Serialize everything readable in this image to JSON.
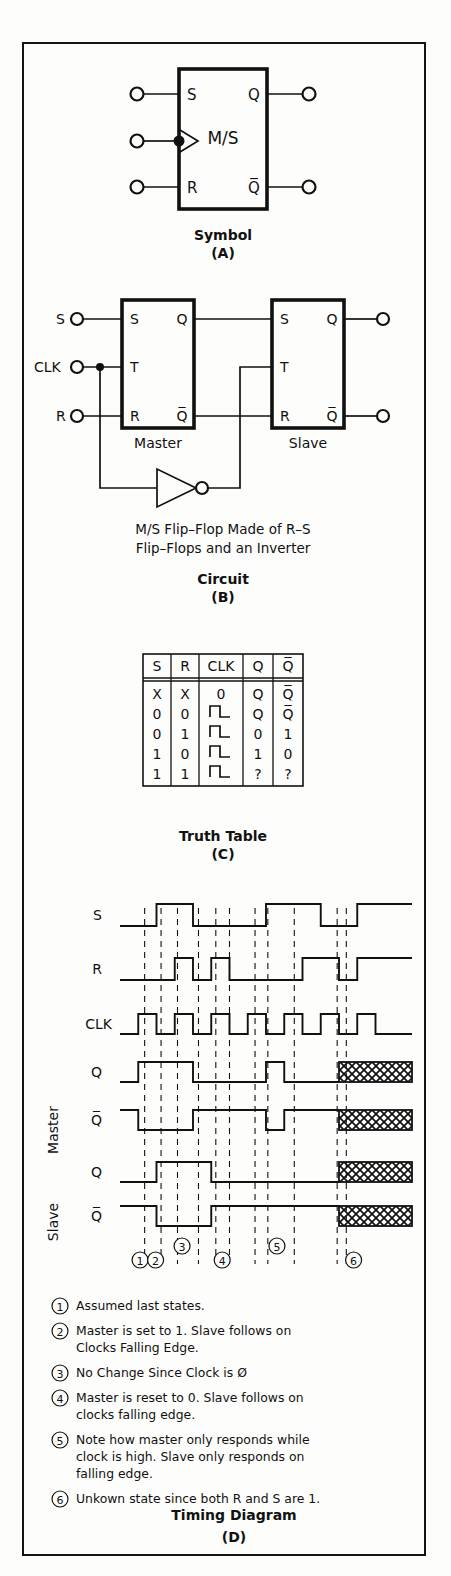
{
  "document": {
    "subject": "Master/Slave Flip-Flop",
    "panels": [
      "A",
      "B",
      "C",
      "D"
    ]
  },
  "symbol_panel": {
    "caption": "Symbol",
    "letter": "(A)",
    "block_label": "M/S",
    "inputs": [
      "S",
      "R"
    ],
    "outputs": [
      "Q",
      "Q̅"
    ],
    "clock_input_is_inverting": true
  },
  "circuit_panel": {
    "caption": "Circuit",
    "letter": "(B)",
    "description_line1": "M/S Flip–Flop Made of R–S",
    "description_line2": "Flip–Flops and an Inverter",
    "input_labels": [
      "S",
      "CLK",
      "R"
    ],
    "master_label": "Master",
    "slave_label": "Slave",
    "master_pins": {
      "left": [
        "S",
        "T",
        "R"
      ],
      "right": [
        "Q",
        "Q̅"
      ]
    },
    "slave_pins": {
      "left": [
        "S",
        "T",
        "R"
      ],
      "right": [
        "Q",
        "Q̅"
      ]
    }
  },
  "truth_table_panel": {
    "caption": "Truth Table",
    "letter": "(C)",
    "headers": [
      "S",
      "R",
      "CLK",
      "Q",
      "Q̅"
    ],
    "rows": [
      {
        "S": "X",
        "R": "X",
        "CLK": "0",
        "Q": "Q",
        "Qbar": "Q̅"
      },
      {
        "S": "0",
        "R": "0",
        "CLK": "pulse",
        "Q": "Q",
        "Qbar": "Q̅"
      },
      {
        "S": "0",
        "R": "1",
        "CLK": "pulse",
        "Q": "0",
        "Qbar": "1"
      },
      {
        "S": "1",
        "R": "0",
        "CLK": "pulse",
        "Q": "1",
        "Qbar": "0"
      },
      {
        "S": "1",
        "R": "1",
        "CLK": "pulse",
        "Q": "?",
        "Qbar": "?"
      }
    ]
  },
  "timing_panel": {
    "caption": "Timing Diagram",
    "letter": "(D)",
    "signal_labels": [
      "S",
      "R",
      "CLK",
      "Q",
      "Q̅",
      "Q",
      "Q̅"
    ],
    "group_labels": [
      "Master",
      "Slave"
    ],
    "markers": [
      "1",
      "2",
      "3",
      "4",
      "5",
      "6"
    ],
    "chart_data": {
      "type": "line",
      "title": "Timing Diagram",
      "xlabel": "",
      "ylabel": "",
      "x": [
        0,
        100
      ],
      "grid": false,
      "legend": "none",
      "note": "Digital logic waveforms, value 0 = low, 1 = high, ? = undefined (cross-hatched)",
      "series": [
        {
          "name": "S",
          "values": [
            0,
            0,
            1,
            1,
            0,
            0,
            0,
            0,
            1,
            1,
            1,
            0,
            0,
            1,
            1,
            1
          ]
        },
        {
          "name": "R",
          "values": [
            0,
            0,
            0,
            1,
            0,
            1,
            0,
            0,
            0,
            0,
            1,
            1,
            0,
            1,
            1,
            1
          ]
        },
        {
          "name": "CLK",
          "values": [
            0,
            1,
            0,
            1,
            0,
            1,
            0,
            1,
            0,
            1,
            0,
            1,
            0,
            1,
            0,
            0
          ]
        },
        {
          "name": "Master Q",
          "values": [
            0,
            1,
            1,
            1,
            0,
            0,
            0,
            0,
            1,
            0,
            0,
            0,
            "?",
            "?",
            "?",
            "?"
          ]
        },
        {
          "name": "Master Q̅",
          "values": [
            1,
            0,
            0,
            0,
            1,
            1,
            1,
            1,
            0,
            1,
            1,
            1,
            "?",
            "?",
            "?",
            "?"
          ]
        },
        {
          "name": "Slave Q",
          "values": [
            0,
            0,
            1,
            1,
            1,
            0,
            0,
            0,
            0,
            0,
            0,
            0,
            "?",
            "?",
            "?",
            "?"
          ]
        },
        {
          "name": "Slave Q̅",
          "values": [
            1,
            1,
            0,
            0,
            0,
            1,
            1,
            1,
            1,
            1,
            1,
            1,
            "?",
            "?",
            "?",
            "?"
          ]
        }
      ]
    }
  },
  "notes": [
    {
      "num": "1",
      "lines": [
        "Assumed last states."
      ]
    },
    {
      "num": "2",
      "lines": [
        "Master is set to 1. Slave follows on",
        "Clocks Falling Edge."
      ]
    },
    {
      "num": "3",
      "lines": [
        "No Change Since Clock is Ø"
      ]
    },
    {
      "num": "4",
      "lines": [
        "Master is reset to 0. Slave follows on",
        "clocks falling edge."
      ]
    },
    {
      "num": "5",
      "lines": [
        "Note how master only responds while",
        "clock is high. Slave only responds on",
        "falling edge."
      ]
    },
    {
      "num": "6",
      "lines": [
        "Unkown state since both R and S are 1."
      ]
    }
  ],
  "colors": {
    "ink": "#111111",
    "paper": "#fdfdfb"
  }
}
